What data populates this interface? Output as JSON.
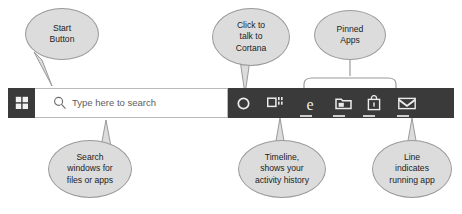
{
  "taskbar": {
    "start_button": {
      "label": "Start",
      "icon": "windows-logo-icon"
    },
    "search": {
      "placeholder": "Type here to search",
      "value": "",
      "icon": "search-icon"
    },
    "cortana": {
      "icon": "cortana-circle-icon"
    },
    "task_view": {
      "icon": "task-view-icon"
    },
    "pinned_apps": [
      {
        "name": "edge",
        "icon": "edge-e-icon"
      },
      {
        "name": "file-explorer",
        "icon": "folder-icon"
      },
      {
        "name": "microsoft-store",
        "icon": "shopping-bag-icon"
      },
      {
        "name": "mail",
        "icon": "envelope-icon"
      }
    ],
    "colors": {
      "taskbar_background": "#3a3a3a",
      "search_field_background": "#ffffff",
      "icon_foreground": "#e8e8e8",
      "running_indicator": "#cfcfcf"
    }
  },
  "callouts": {
    "start": {
      "line1": "Start",
      "line2": "Button"
    },
    "cortana": {
      "line1": "Click to",
      "line2": "talk to",
      "line3": "Cortana"
    },
    "pinned": {
      "line1": "Pinned",
      "line2": "Apps"
    },
    "search": {
      "line1": "Search",
      "line2": "windows for",
      "line3": "files or apps"
    },
    "timeline": {
      "line1": "Timeline,",
      "line2": "shows your",
      "line3": "activity history"
    },
    "running": {
      "line1": "Line",
      "line2": "indicates",
      "line3": "running app"
    },
    "colors": {
      "fill": "#dcdcdc",
      "border": "#9a9a9a",
      "text": "#1d1d1d"
    }
  }
}
